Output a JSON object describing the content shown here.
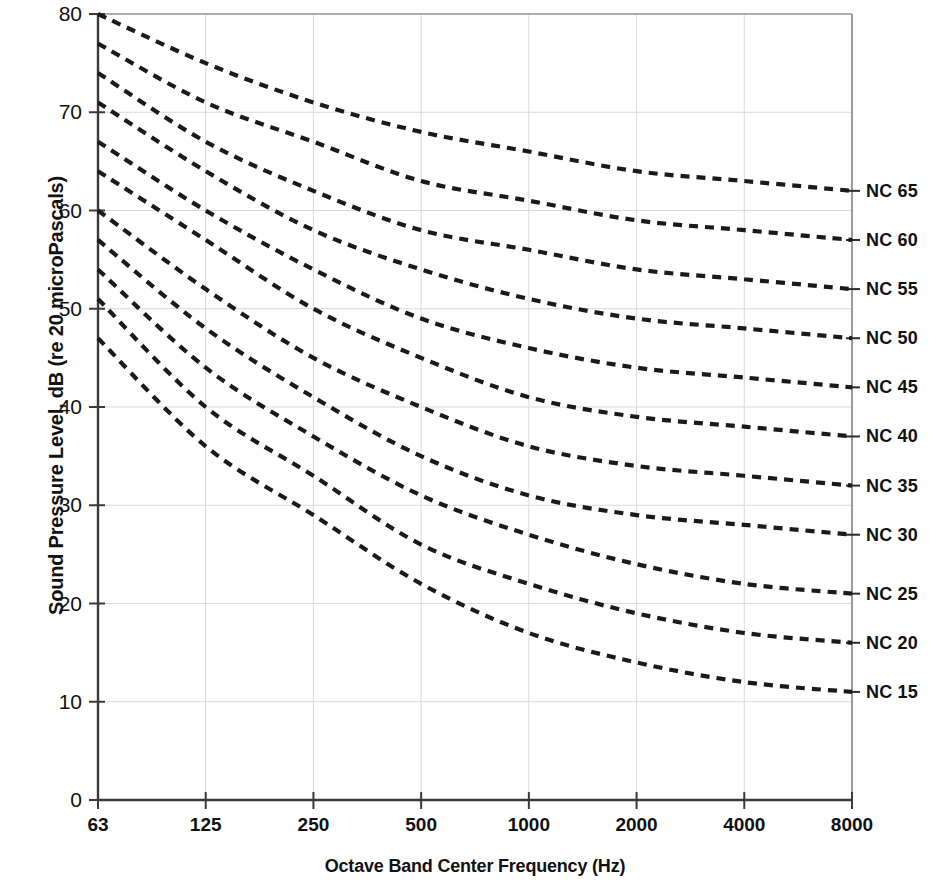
{
  "chart_data": {
    "type": "line",
    "title": "",
    "xlabel": "Octave Band Center Frequency (Hz)",
    "ylabel": "Sound Pressure Level, dB (re 20 microPascals)",
    "x_scale": "octave-band (evenly spaced categories)",
    "categories": [
      "63",
      "125",
      "250",
      "500",
      "1000",
      "2000",
      "4000",
      "8000"
    ],
    "x_tick_labels": [
      "63",
      "125",
      "250",
      "500",
      "1000",
      "2000",
      "4000",
      "8000"
    ],
    "y_tick_labels": [
      "0",
      "10",
      "20",
      "30",
      "40",
      "50",
      "60",
      "70",
      "80"
    ],
    "y_ticks": [
      0,
      10,
      20,
      30,
      40,
      50,
      60,
      70,
      80
    ],
    "ylim": [
      0,
      80
    ],
    "grid": true,
    "grid_color": "#d9d9d9",
    "line_style": "dashed",
    "line_color": "#1a1a1a",
    "legend_position": "right-of-plot (inline curve labels)",
    "series": [
      {
        "name": "NC 65",
        "label": "NC 65",
        "values": [
          80,
          75,
          71,
          68,
          66,
          64,
          63,
          62
        ]
      },
      {
        "name": "NC 60",
        "label": "NC 60",
        "values": [
          77,
          71,
          67,
          63,
          61,
          59,
          58,
          57
        ]
      },
      {
        "name": "NC 55",
        "label": "NC 55",
        "values": [
          74,
          67,
          62,
          58,
          56,
          54,
          53,
          52
        ]
      },
      {
        "name": "NC 50",
        "label": "NC 50",
        "values": [
          71,
          64,
          58,
          54,
          51,
          49,
          48,
          47
        ]
      },
      {
        "name": "NC 45",
        "label": "NC 45",
        "values": [
          67,
          60,
          54,
          49,
          46,
          44,
          43,
          42
        ]
      },
      {
        "name": "NC 40",
        "label": "NC 40",
        "values": [
          64,
          57,
          50,
          45,
          41,
          39,
          38,
          37
        ]
      },
      {
        "name": "NC 35",
        "label": "NC 35",
        "values": [
          60,
          52,
          45,
          40,
          36,
          34,
          33,
          32
        ]
      },
      {
        "name": "NC 30",
        "label": "NC 30",
        "values": [
          57,
          48,
          41,
          35,
          31,
          29,
          28,
          27
        ]
      },
      {
        "name": "NC 25",
        "label": "NC 25",
        "values": [
          54,
          44,
          37,
          31,
          27,
          24,
          22,
          21
        ]
      },
      {
        "name": "NC 20",
        "label": "NC 20",
        "values": [
          51,
          40,
          33,
          26,
          22,
          19,
          17,
          16
        ]
      },
      {
        "name": "NC 15",
        "label": "NC 15",
        "values": [
          47,
          36,
          29,
          22,
          17,
          14,
          12,
          11
        ]
      }
    ]
  },
  "axis": {
    "y_title": "Sound Pressure Level, dB (re 20 microPascals)",
    "x_title": "Octave Band Center Frequency (Hz)"
  }
}
